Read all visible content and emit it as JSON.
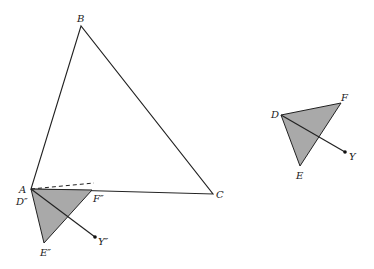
{
  "figure": {
    "main_triangle": {
      "vertices": {
        "A": "A",
        "B": "B",
        "C": "C"
      }
    },
    "image_triangle": {
      "vertices": {
        "D": "D″",
        "E": "E″",
        "F": "F″"
      },
      "point": "Y″"
    },
    "original_triangle": {
      "vertices": {
        "D": "D",
        "E": "E",
        "F": "F"
      },
      "point": "Y"
    },
    "colors": {
      "fill": "#a9a9a9",
      "stroke": "#222222"
    }
  }
}
